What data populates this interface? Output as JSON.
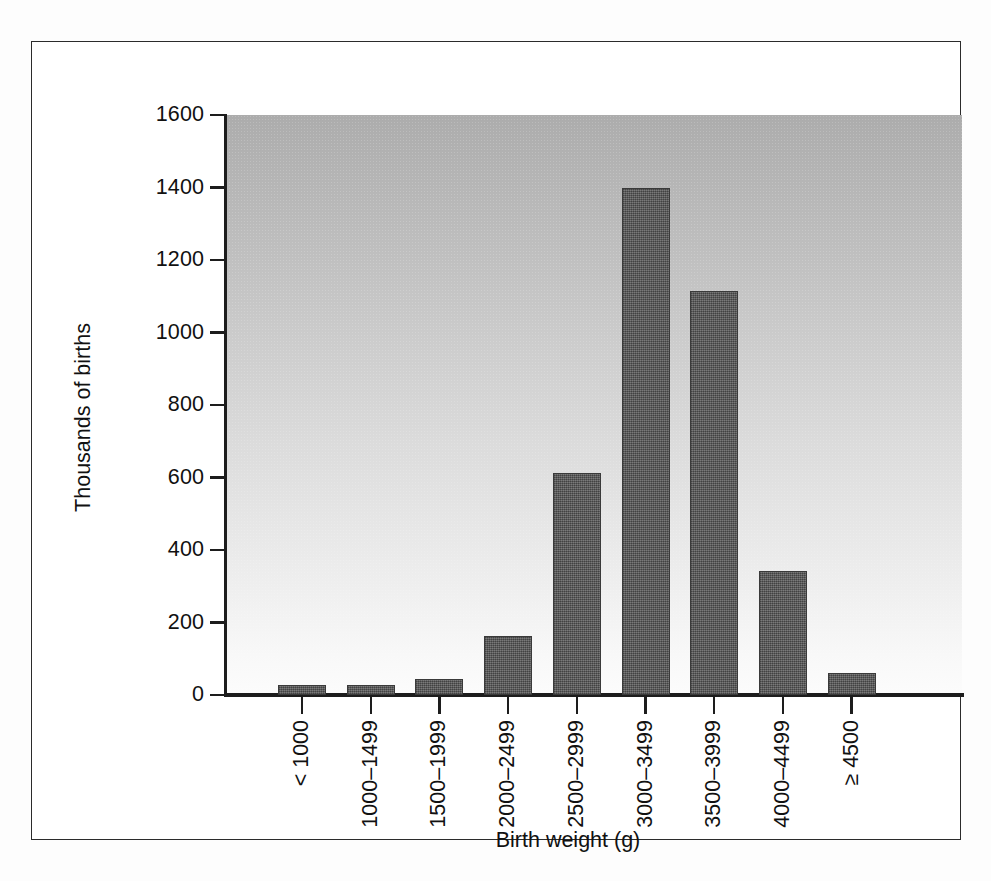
{
  "figure": {
    "alt_name": "birth-weight-distribution-bar-chart"
  },
  "chart_data": {
    "type": "bar",
    "title": "",
    "subtitle": "",
    "xlabel": "Birth weight (g)",
    "ylabel": "Thousands of births",
    "categories": [
      "< 1000",
      "1000–1499",
      "1500–1999",
      "2000–2499",
      "2500–2999",
      "3000–3499",
      "3500–3999",
      "4000–4499",
      "≥ 4500"
    ],
    "values": [
      27,
      28,
      45,
      163,
      613,
      1398,
      1115,
      343,
      62
    ],
    "ylim": [
      0,
      1600
    ],
    "yticks": [
      0,
      200,
      400,
      600,
      800,
      1000,
      1200,
      1400,
      1600
    ],
    "ytick_labels": [
      "0",
      "200",
      "400",
      "600",
      "800",
      "1000",
      "1200",
      "1400",
      "1600"
    ],
    "grid": false,
    "legend": null,
    "legend_position": "none",
    "bar_color": "#5c5c5c",
    "bar_edge_color": "#3a3a3a",
    "plot_background_top_color": "#acacac",
    "plot_background_bottom_color": "#fcfcfc",
    "frame_color": "#2b2b2b",
    "axis_color": "#1d1d1d",
    "xtick_label_rotation": -90
  }
}
